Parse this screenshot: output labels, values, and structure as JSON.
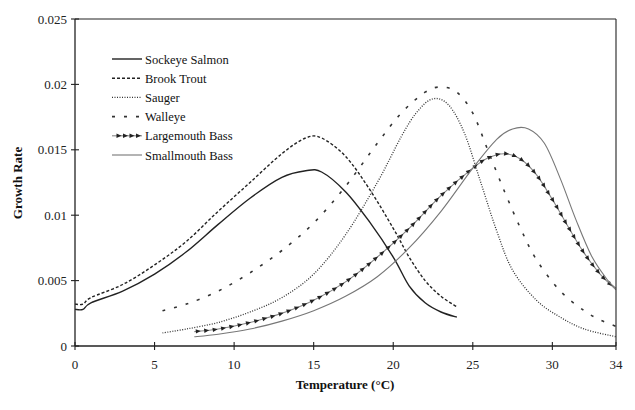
{
  "chart_data": {
    "type": "line",
    "title": "",
    "xlabel": "Temperature (°C)",
    "ylabel": "Growth Rate",
    "xlim": [
      0,
      34
    ],
    "ylim": [
      0,
      0.025
    ],
    "xticks": [
      0,
      5,
      10,
      15,
      20,
      25,
      30,
      34
    ],
    "xtick_labels": [
      "0",
      "5",
      "10",
      "15",
      "20",
      "25",
      "30",
      "34"
    ],
    "yticks": [
      0,
      0.005,
      0.01,
      0.015,
      0.02,
      0.025
    ],
    "ytick_labels": [
      "0",
      "0.005",
      "0.01",
      "0.015",
      "0.02",
      "0.025"
    ],
    "grid": false,
    "legend_position": "top-left",
    "series": [
      {
        "name": "Sockeye Salmon",
        "style": "solid",
        "color": "#222222",
        "points": [
          [
            0,
            0.0028
          ],
          [
            0.5,
            0.0028
          ],
          [
            1,
            0.0033
          ],
          [
            3,
            0.0042
          ],
          [
            5,
            0.0055
          ],
          [
            7,
            0.0072
          ],
          [
            9,
            0.0093
          ],
          [
            11,
            0.0113
          ],
          [
            13,
            0.0129
          ],
          [
            14.5,
            0.0134
          ],
          [
            15.5,
            0.0133
          ],
          [
            17,
            0.0118
          ],
          [
            18.5,
            0.0095
          ],
          [
            20,
            0.0068
          ],
          [
            21,
            0.0046
          ],
          [
            22,
            0.0033
          ],
          [
            23,
            0.0026
          ],
          [
            24,
            0.0022
          ]
        ]
      },
      {
        "name": "Brook Trout",
        "style": "dashed",
        "color": "#222222",
        "points": [
          [
            0,
            0.0032
          ],
          [
            0.5,
            0.0032
          ],
          [
            1,
            0.0037
          ],
          [
            3,
            0.0047
          ],
          [
            5,
            0.0062
          ],
          [
            7,
            0.008
          ],
          [
            9,
            0.0103
          ],
          [
            11,
            0.0125
          ],
          [
            13,
            0.0147
          ],
          [
            14.5,
            0.0159
          ],
          [
            15.5,
            0.0159
          ],
          [
            17,
            0.0145
          ],
          [
            18.5,
            0.012
          ],
          [
            20,
            0.009
          ],
          [
            21,
            0.0068
          ],
          [
            22,
            0.005
          ],
          [
            23,
            0.0038
          ],
          [
            24,
            0.003
          ]
        ]
      },
      {
        "name": "Sauger",
        "style": "dotted",
        "color": "#333333",
        "points": [
          [
            5.5,
            0.001
          ],
          [
            7,
            0.0013
          ],
          [
            9,
            0.0018
          ],
          [
            11,
            0.0026
          ],
          [
            13,
            0.0037
          ],
          [
            15,
            0.0055
          ],
          [
            17,
            0.0085
          ],
          [
            19,
            0.0125
          ],
          [
            20.5,
            0.016
          ],
          [
            21.5,
            0.0179
          ],
          [
            22.5,
            0.0189
          ],
          [
            23.5,
            0.0184
          ],
          [
            24.5,
            0.0162
          ],
          [
            25.5,
            0.0125
          ],
          [
            26.5,
            0.0088
          ],
          [
            27.5,
            0.0058
          ],
          [
            29,
            0.0035
          ],
          [
            30.5,
            0.0022
          ],
          [
            32,
            0.0013
          ],
          [
            34,
            0.0007
          ]
        ]
      },
      {
        "name": "Walleye",
        "style": "dashdot",
        "color": "#333333",
        "points": [
          [
            5.5,
            0.0027
          ],
          [
            7,
            0.0032
          ],
          [
            9,
            0.0042
          ],
          [
            11,
            0.0056
          ],
          [
            13,
            0.0073
          ],
          [
            15,
            0.0094
          ],
          [
            17,
            0.0122
          ],
          [
            19,
            0.0155
          ],
          [
            20.5,
            0.0178
          ],
          [
            22,
            0.0194
          ],
          [
            23,
            0.0198
          ],
          [
            24,
            0.0194
          ],
          [
            25,
            0.0178
          ],
          [
            26,
            0.0148
          ],
          [
            27,
            0.0118
          ],
          [
            28,
            0.009
          ],
          [
            29,
            0.0066
          ],
          [
            30.5,
            0.0042
          ],
          [
            32,
            0.0027
          ],
          [
            33,
            0.002
          ],
          [
            34,
            0.0015
          ]
        ]
      },
      {
        "name": "Largemouth Bass",
        "style": "arrows",
        "color": "#555555",
        "points": [
          [
            7.5,
            0.0011
          ],
          [
            9,
            0.0013
          ],
          [
            11,
            0.0018
          ],
          [
            13,
            0.0025
          ],
          [
            15,
            0.0035
          ],
          [
            17,
            0.0049
          ],
          [
            19,
            0.0068
          ],
          [
            21,
            0.009
          ],
          [
            23,
            0.0115
          ],
          [
            25,
            0.0136
          ],
          [
            26,
            0.0144
          ],
          [
            27,
            0.0147
          ],
          [
            28,
            0.0143
          ],
          [
            29,
            0.0131
          ],
          [
            30,
            0.0112
          ],
          [
            31,
            0.0091
          ],
          [
            32,
            0.0071
          ],
          [
            33,
            0.0055
          ],
          [
            34,
            0.0043
          ]
        ]
      },
      {
        "name": "Smallmouth Bass",
        "style": "thin",
        "color": "#777777",
        "points": [
          [
            7.5,
            0.0007
          ],
          [
            9,
            0.0009
          ],
          [
            11,
            0.0013
          ],
          [
            13,
            0.0019
          ],
          [
            15,
            0.0027
          ],
          [
            17,
            0.0038
          ],
          [
            19,
            0.0053
          ],
          [
            21,
            0.0075
          ],
          [
            23,
            0.0103
          ],
          [
            25,
            0.0136
          ],
          [
            26.5,
            0.0158
          ],
          [
            27.5,
            0.0166
          ],
          [
            28.5,
            0.0166
          ],
          [
            29.5,
            0.0155
          ],
          [
            30.5,
            0.0128
          ],
          [
            31.5,
            0.0096
          ],
          [
            32.5,
            0.0068
          ],
          [
            33.5,
            0.005
          ],
          [
            34,
            0.0044
          ]
        ]
      }
    ]
  }
}
